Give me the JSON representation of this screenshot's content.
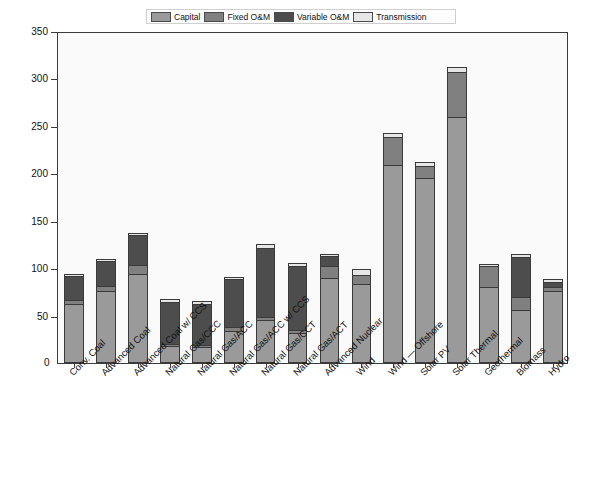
{
  "chart_data": {
    "type": "bar",
    "stacked": true,
    "title": "",
    "xlabel": "",
    "ylabel": "2009 USD/MWh",
    "ylim": [
      0,
      350
    ],
    "yticks": [
      0,
      50,
      100,
      150,
      200,
      250,
      300,
      350
    ],
    "grid": false,
    "legend_position": "top",
    "legend": [
      "Capital",
      "Fixed O&M",
      "Variable O&M",
      "Transmission"
    ],
    "colors": {
      "Capital": "#9a9a9a",
      "Fixed O&M": "#808080",
      "Variable O&M": "#4d4d4d",
      "Transmission": "#e6e6e6"
    },
    "categories": [
      "Conv. Coal",
      "Advanced Coal",
      "Advanced Coal w/ CCS",
      "Natural Gas/CCC",
      "Natural Gas/ACC",
      "Natural Gas/ACC w/ CCS",
      "Natural Gas/CCT",
      "Natural Gas/ACT",
      "Advanced Nuclear",
      "Wind",
      "Wind — Offshore",
      "Solar PV",
      "Solar Thermal",
      "Geothermal",
      "Biomass",
      "Hydro"
    ],
    "series": [
      {
        "name": "Capital",
        "values": [
          62,
          76,
          94,
          18,
          17,
          34,
          45,
          32,
          90,
          83,
          209,
          195,
          259,
          80,
          56,
          76
        ]
      },
      {
        "name": "Fixed O&M",
        "values": [
          4,
          5,
          9,
          2,
          2,
          4,
          4,
          3,
          12,
          10,
          29,
          13,
          48,
          22,
          14,
          4
        ]
      },
      {
        "name": "Variable O&M",
        "values": [
          26,
          27,
          32,
          44,
          43,
          51,
          72,
          67,
          11,
          0,
          0,
          0,
          0,
          0,
          42,
          5
        ]
      },
      {
        "name": "Transmission",
        "values": [
          2,
          2,
          2,
          3,
          3,
          2,
          4,
          3,
          2,
          6,
          5,
          4,
          5,
          2,
          3,
          4
        ]
      }
    ],
    "totals": [
      94,
      110,
      137,
      67,
      65,
      91,
      125,
      105,
      115,
      99,
      243,
      212,
      312,
      104,
      115,
      89
    ]
  },
  "axis": {
    "y_title": "2009 USD/MWh",
    "zero_label": "0",
    "tick_labels": [
      "350",
      "300",
      "250",
      "200",
      "150",
      "100",
      "50"
    ]
  }
}
